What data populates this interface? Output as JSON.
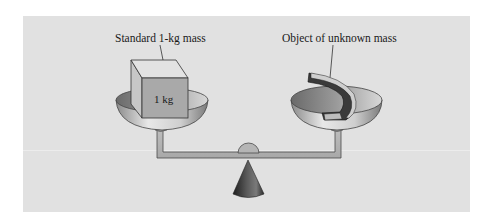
{
  "figure": {
    "type": "balance-scale-diagram",
    "labels": {
      "left": "Standard 1-kg mass",
      "right": "Object of unknown mass",
      "cube": "1 kg"
    },
    "colors": {
      "panel": "#e1e1e1",
      "background": "#ffffff",
      "metal_light": "#d6d6d6",
      "metal_dark": "#6e6e6e",
      "cube_front": "#a9a9a9",
      "cube_top": "#dedede",
      "cube_side": "#c7c7c7",
      "cone": "#3a3a3a",
      "text": "#1a1a1a"
    }
  }
}
